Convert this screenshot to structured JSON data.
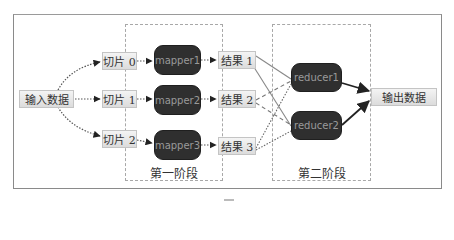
{
  "diagram": {
    "type": "mapreduce-flow",
    "input": {
      "label": "输入数据"
    },
    "slices": [
      {
        "label": "切片 0"
      },
      {
        "label": "切片 1"
      },
      {
        "label": "切片 2"
      }
    ],
    "mappers": [
      {
        "label": "mapper1"
      },
      {
        "label": "mapper2"
      },
      {
        "label": "mapper3"
      }
    ],
    "results": [
      {
        "label": "结果 1"
      },
      {
        "label": "结果 2"
      },
      {
        "label": "结果 3"
      }
    ],
    "reducers": [
      {
        "label": "reducer1"
      },
      {
        "label": "reducer2"
      }
    ],
    "output": {
      "label": "输出数据"
    },
    "stages": [
      {
        "label": "第一阶段"
      },
      {
        "label": "第二阶段"
      }
    ],
    "edges": [
      {
        "from": "输入数据",
        "to": "切片 0",
        "style": "dotted-curve"
      },
      {
        "from": "输入数据",
        "to": "切片 1",
        "style": "dotted"
      },
      {
        "from": "输入数据",
        "to": "切片 2",
        "style": "dotted-curve"
      },
      {
        "from": "切片 0",
        "to": "mapper1",
        "style": "dotted"
      },
      {
        "from": "切片 1",
        "to": "mapper2",
        "style": "dotted"
      },
      {
        "from": "切片 2",
        "to": "mapper3",
        "style": "dotted"
      },
      {
        "from": "mapper1",
        "to": "结果 1",
        "style": "dotted"
      },
      {
        "from": "mapper2",
        "to": "结果 2",
        "style": "dotted"
      },
      {
        "from": "mapper3",
        "to": "结果 3",
        "style": "dotted"
      },
      {
        "from": "结果 1",
        "to": "reducer1",
        "style": "solid"
      },
      {
        "from": "结果 1",
        "to": "reducer2",
        "style": "solid"
      },
      {
        "from": "结果 2",
        "to": "reducer1",
        "style": "dashed"
      },
      {
        "from": "结果 2",
        "to": "reducer2",
        "style": "dashed"
      },
      {
        "from": "结果 3",
        "to": "reducer1",
        "style": "dotted"
      },
      {
        "from": "结果 3",
        "to": "reducer2",
        "style": "dotted"
      },
      {
        "from": "reducer1",
        "to": "输出数据",
        "style": "solid-arrow"
      },
      {
        "from": "reducer2",
        "to": "输出数据",
        "style": "solid-arrow"
      }
    ]
  },
  "colors": {
    "frame": "#8a8a8a",
    "process_fill": "#2f2f2f",
    "process_text": "#9a9a9a",
    "data_fill": "#e6e6e6",
    "edge": "#555555"
  }
}
